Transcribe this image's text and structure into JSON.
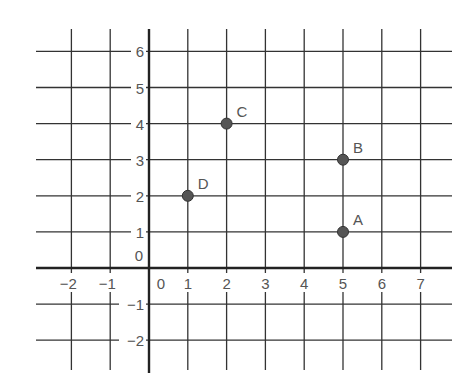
{
  "chart_data": {
    "type": "scatter",
    "title": "",
    "xlabel": "",
    "ylabel": "",
    "xlim": [
      -3,
      8
    ],
    "ylim": [
      -2.8,
      6.6
    ],
    "grid": true,
    "x_ticks": [
      -2,
      -1,
      0,
      1,
      2,
      3,
      4,
      5,
      6,
      7
    ],
    "y_ticks": [
      -2,
      -1,
      0,
      1,
      2,
      3,
      4,
      5,
      6
    ],
    "points": [
      {
        "label": "A",
        "x": 5,
        "y": 1
      },
      {
        "label": "B",
        "x": 5,
        "y": 3
      },
      {
        "label": "C",
        "x": 2,
        "y": 4
      },
      {
        "label": "D",
        "x": 1,
        "y": 2
      }
    ]
  },
  "colors": {
    "grid_line": "#333333",
    "axis_line": "#222222",
    "point_fill": "#555555",
    "label_text": "#555555"
  }
}
